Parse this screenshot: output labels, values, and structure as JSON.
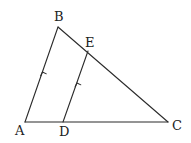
{
  "diagram": {
    "title": "",
    "points": {
      "A": {
        "label": "A",
        "x": 25,
        "y": 122,
        "lx": 15,
        "ly": 135
      },
      "B": {
        "label": "B",
        "x": 58,
        "y": 27,
        "lx": 54,
        "ly": 21
      },
      "C": {
        "label": "C",
        "x": 168,
        "y": 122,
        "lx": 173,
        "ly": 130
      },
      "D": {
        "label": "D",
        "x": 63,
        "y": 122,
        "lx": 60,
        "ly": 136
      },
      "E": {
        "label": "E",
        "x": 88,
        "y": 51,
        "lx": 86,
        "ly": 47
      }
    },
    "segments": [
      "AB",
      "BC",
      "AC",
      "DE"
    ],
    "parallel_marks": [
      "AB",
      "DE"
    ],
    "relation": "DE parallel to AB",
    "stroke_color": "#2b2b2b"
  }
}
